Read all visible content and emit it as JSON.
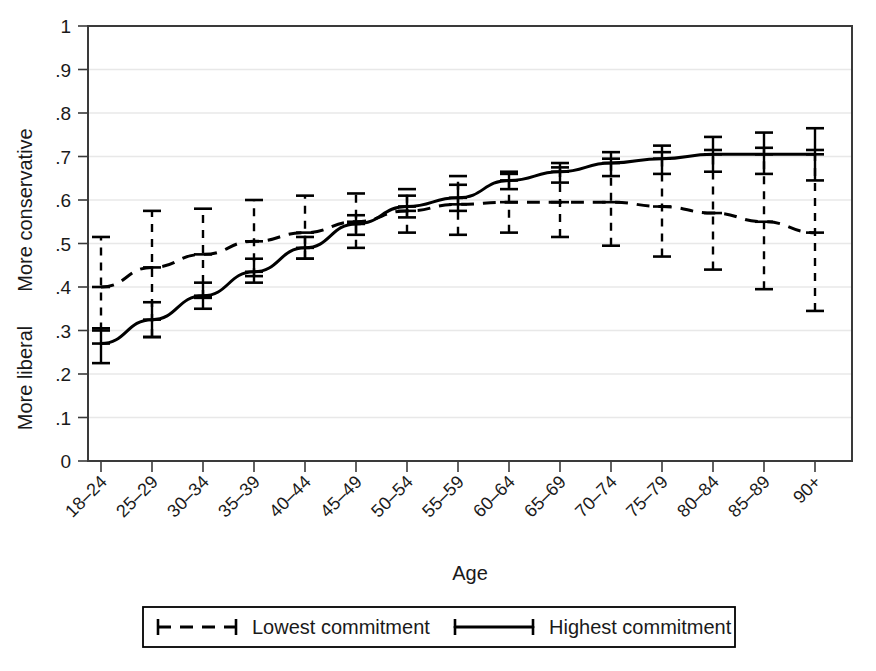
{
  "chart_data": {
    "type": "line",
    "title": "",
    "xlabel": "Age",
    "ylabel_top": "More conservative",
    "ylabel_bottom": "More liberal",
    "ylim": [
      0,
      1
    ],
    "ytick_labels": [
      "0",
      ".1",
      ".2",
      ".3",
      ".4",
      ".5",
      ".6",
      ".7",
      ".8",
      ".9",
      "1"
    ],
    "ytick_values": [
      0,
      0.1,
      0.2,
      0.3,
      0.4,
      0.5,
      0.6,
      0.7,
      0.8,
      0.9,
      1
    ],
    "grid": true,
    "legend_position": "below-plot",
    "categories": [
      "18–24",
      "25–29",
      "30–34",
      "35–39",
      "40–44",
      "45–49",
      "50–54",
      "55–59",
      "60–64",
      "65–69",
      "70–74",
      "75–79",
      "80–84",
      "85–89",
      "90+"
    ],
    "series": [
      {
        "name": "Lowest commitment",
        "style": "dashed",
        "values": [
          0.4,
          0.445,
          0.475,
          0.505,
          0.525,
          0.55,
          0.575,
          0.59,
          0.595,
          0.595,
          0.595,
          0.585,
          0.57,
          0.55,
          0.525
        ],
        "ci_low": [
          0.3,
          0.285,
          0.375,
          0.425,
          0.465,
          0.49,
          0.525,
          0.52,
          0.525,
          0.515,
          0.495,
          0.47,
          0.44,
          0.395,
          0.345
        ],
        "ci_high": [
          0.515,
          0.575,
          0.58,
          0.6,
          0.61,
          0.615,
          0.625,
          0.655,
          0.66,
          0.675,
          0.695,
          0.71,
          0.715,
          0.72,
          0.715
        ]
      },
      {
        "name": "Highest commitment",
        "style": "solid",
        "values": [
          0.27,
          0.325,
          0.38,
          0.435,
          0.49,
          0.545,
          0.585,
          0.605,
          0.645,
          0.665,
          0.685,
          0.695,
          0.705,
          0.705,
          0.705
        ],
        "ci_low": [
          0.225,
          0.285,
          0.35,
          0.41,
          0.465,
          0.52,
          0.56,
          0.575,
          0.625,
          0.64,
          0.655,
          0.66,
          0.665,
          0.66,
          0.645
        ],
        "ci_high": [
          0.305,
          0.365,
          0.41,
          0.465,
          0.515,
          0.565,
          0.61,
          0.635,
          0.665,
          0.685,
          0.71,
          0.725,
          0.745,
          0.755,
          0.765
        ]
      }
    ]
  },
  "legend": {
    "items": [
      {
        "label": "Lowest commitment",
        "style": "dashed"
      },
      {
        "label": "Highest commitment",
        "style": "solid"
      }
    ]
  }
}
